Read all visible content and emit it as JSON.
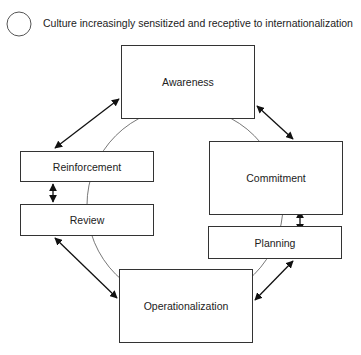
{
  "legend": {
    "text": "Culture increasingly sensitized and receptive to internationalization",
    "icon": "circle-icon"
  },
  "nodes": {
    "awareness": "Awareness",
    "commitment": "Commitment",
    "planning": "Planning",
    "operationalization": "Operationalization",
    "review": "Review",
    "reinforcement": "Reinforcement"
  }
}
